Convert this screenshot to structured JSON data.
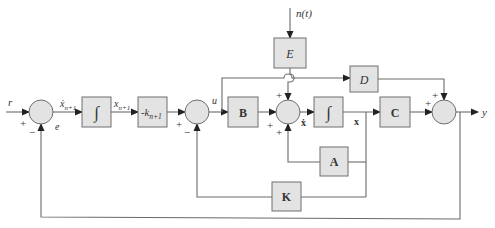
{
  "diagram": {
    "type": "block-diagram",
    "title": "",
    "inputs": {
      "reference": "r",
      "disturbance": "n(t)"
    },
    "outputs": {
      "output": "y"
    },
    "signals": {
      "error": "e",
      "xdot_n1": "ẋ",
      "xdot_n1_sub": "n+1",
      "x_n1": "x",
      "x_n1_sub": "n+1",
      "u": "u",
      "xdot": "ẋ",
      "x": "x"
    },
    "blocks": [
      {
        "id": "integrator-1",
        "label": "∫"
      },
      {
        "id": "gain-k",
        "label_prefix": "-k",
        "label_sub": "n+1"
      },
      {
        "id": "B",
        "label": "B"
      },
      {
        "id": "E",
        "label": "E"
      },
      {
        "id": "D",
        "label": "D"
      },
      {
        "id": "integrator-2",
        "label": "∫"
      },
      {
        "id": "C",
        "label": "C"
      },
      {
        "id": "A",
        "label": "A"
      },
      {
        "id": "K",
        "label": "K"
      }
    ],
    "summing_junctions": [
      {
        "id": "sum-1",
        "signs": [
          "+",
          "−"
        ]
      },
      {
        "id": "sum-2",
        "signs": [
          "+",
          "−"
        ]
      },
      {
        "id": "sum-3",
        "signs": [
          "+",
          "+",
          "+"
        ]
      },
      {
        "id": "sum-4",
        "signs": [
          "+",
          "+"
        ]
      }
    ],
    "signs": {
      "plus": "+",
      "minus": "−"
    }
  }
}
